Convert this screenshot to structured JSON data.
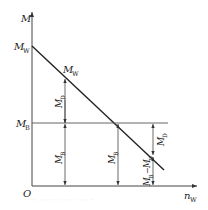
{
  "diagram": {
    "type": "torque-balance-diagram",
    "axes": {
      "y_label": "M",
      "x_label_main": "n",
      "x_label_sub": "W",
      "origin_label": "O"
    },
    "intercept_label": {
      "main": "M",
      "sub": "W"
    },
    "line_label": {
      "main": "M",
      "sub": "W"
    },
    "horizontal_level_label": {
      "main": "M",
      "sub": "B"
    },
    "arrows": [
      {
        "id": "md-left",
        "label_main": "M",
        "label_sub": "D"
      },
      {
        "id": "mb-left",
        "label_main": "M",
        "label_sub": "B"
      },
      {
        "id": "mb-middle",
        "label_main": "M",
        "label_sub": "B"
      },
      {
        "id": "md-right",
        "label_main": "M",
        "label_sub": "D"
      },
      {
        "id": "mb-minus-md",
        "label": "M_B − M_D",
        "label_main1": "M",
        "label_sub1": "B",
        "minus": "−",
        "label_main2": "M",
        "label_sub2": "D"
      }
    ],
    "colors": {
      "line": "#222222",
      "axis": "#444444",
      "thin": "#555555",
      "background": "#ffffff"
    }
  },
  "caption": {
    "text": "··· ·· ·· · ·· ··· · ··· ··"
  }
}
